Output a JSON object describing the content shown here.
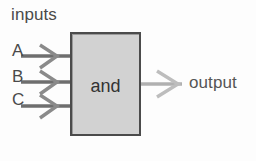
{
  "diagram": {
    "title_label": "inputs",
    "gate": {
      "label": "and",
      "fill_color": "#d2d2d2",
      "border_color": "#4b4b4b"
    },
    "inputs": [
      {
        "label": "A",
        "wire_color": "#6e6e6e"
      },
      {
        "label": "B",
        "wire_color": "#6e6e6e"
      },
      {
        "label": "C",
        "wire_color": "#6e6e6e"
      }
    ],
    "output": {
      "label": "output",
      "wire_color": "#a9a9a9"
    }
  }
}
